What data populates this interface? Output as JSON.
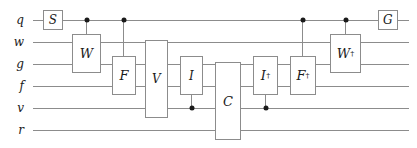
{
  "diagram": {
    "wire_color": "#8c8c8c",
    "ink_color": "#1a1a1a",
    "background": "#ffffff",
    "wires": [
      {
        "label": "q",
        "y": 20
      },
      {
        "label": "w",
        "y": 42
      },
      {
        "label": "g",
        "y": 64
      },
      {
        "label": "f",
        "y": 86
      },
      {
        "label": "v",
        "y": 108
      },
      {
        "label": "r",
        "y": 130
      }
    ],
    "gates": [
      {
        "name": "S",
        "base": "S",
        "dagger": false,
        "x": 43,
        "y": 10,
        "w": 20,
        "h": 20
      },
      {
        "name": "W",
        "base": "W",
        "dagger": false,
        "x": 72,
        "y": 34,
        "w": 29,
        "h": 39
      },
      {
        "name": "F",
        "base": "F",
        "dagger": false,
        "x": 112,
        "y": 56,
        "w": 24,
        "h": 39
      },
      {
        "name": "V",
        "base": "V",
        "dagger": false,
        "x": 145,
        "y": 40,
        "w": 23,
        "h": 78
      },
      {
        "name": "I",
        "base": "I",
        "dagger": false,
        "x": 180,
        "y": 56,
        "w": 23,
        "h": 39
      },
      {
        "name": "C",
        "base": "C",
        "dagger": false,
        "x": 215,
        "y": 62,
        "w": 26,
        "h": 78
      },
      {
        "name": "Idag",
        "base": "I",
        "dagger": true,
        "x": 253,
        "y": 56,
        "w": 25,
        "h": 39
      },
      {
        "name": "Fdag",
        "base": "F",
        "dagger": true,
        "x": 290,
        "y": 56,
        "w": 26,
        "h": 39
      },
      {
        "name": "Wdag",
        "base": "W",
        "dagger": true,
        "x": 330,
        "y": 34,
        "w": 31,
        "h": 39
      },
      {
        "name": "G",
        "base": "G",
        "dagger": false,
        "x": 378,
        "y": 10,
        "w": 20,
        "h": 20
      }
    ],
    "controls": [
      {
        "name": "ctrl-q-to-W",
        "x": 86,
        "dot_y": 20,
        "line_from": 20,
        "line_to": 34
      },
      {
        "name": "ctrl-q-to-F",
        "x": 123,
        "dot_y": 20,
        "line_from": 20,
        "line_to": 56
      },
      {
        "name": "ctrl-v-to-I",
        "x": 191,
        "dot_y": 108,
        "line_from": 95,
        "line_to": 108
      },
      {
        "name": "ctrl-v-to-Idag",
        "x": 265,
        "dot_y": 108,
        "line_from": 95,
        "line_to": 108
      },
      {
        "name": "ctrl-q-to-Fdag",
        "x": 302,
        "dot_y": 20,
        "line_from": 20,
        "line_to": 56
      },
      {
        "name": "ctrl-q-to-Wdag",
        "x": 345,
        "dot_y": 20,
        "line_from": 20,
        "line_to": 34
      }
    ],
    "wire_span": {
      "x_start": 33,
      "x_end": 409
    },
    "label_x": 5,
    "dagger_glyph": "†"
  }
}
